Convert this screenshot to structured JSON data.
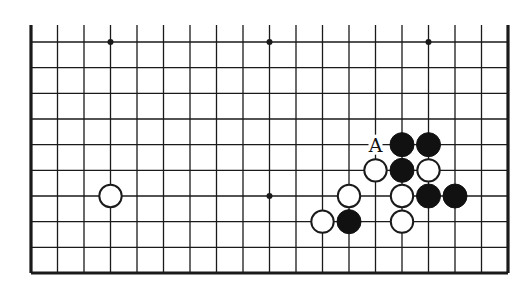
{
  "diagram": {
    "type": "go-board-partial",
    "board_size": 19,
    "visible_rows_from_bottom": 10,
    "colors": {
      "line": "#1a1a1a",
      "black_stone": "#111111",
      "white_stone": "#ffffff",
      "background": "#ffffff"
    },
    "star_points": [
      {
        "col": 4,
        "row": 10
      },
      {
        "col": 10,
        "row": 10
      },
      {
        "col": 16,
        "row": 10
      },
      {
        "col": 4,
        "row": 4
      },
      {
        "col": 10,
        "row": 4
      },
      {
        "col": 16,
        "row": 4
      }
    ],
    "stones": [
      {
        "color": "white",
        "col": 4,
        "row": 4
      },
      {
        "color": "black",
        "col": 15,
        "row": 6
      },
      {
        "color": "black",
        "col": 16,
        "row": 6
      },
      {
        "color": "white",
        "col": 14,
        "row": 5
      },
      {
        "color": "black",
        "col": 15,
        "row": 5
      },
      {
        "color": "white",
        "col": 16,
        "row": 5
      },
      {
        "color": "white",
        "col": 13,
        "row": 4
      },
      {
        "color": "white",
        "col": 15,
        "row": 4
      },
      {
        "color": "black",
        "col": 16,
        "row": 4
      },
      {
        "color": "black",
        "col": 17,
        "row": 4
      },
      {
        "color": "white",
        "col": 12,
        "row": 3
      },
      {
        "color": "black",
        "col": 13,
        "row": 3
      },
      {
        "color": "white",
        "col": 15,
        "row": 3
      }
    ],
    "labels": [
      {
        "text": "A",
        "col": 14,
        "row": 6
      }
    ]
  }
}
